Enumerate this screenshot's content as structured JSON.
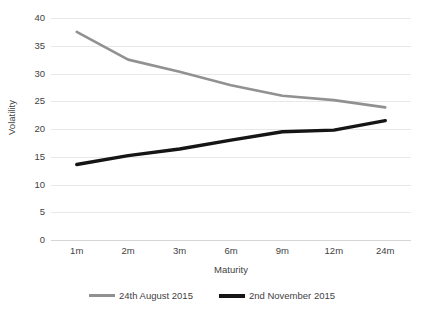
{
  "chart_data": {
    "type": "line",
    "title": "",
    "xlabel": "Maturity",
    "ylabel": "Volatility",
    "categories": [
      "1m",
      "2m",
      "3m",
      "6m",
      "9m",
      "12m",
      "24m"
    ],
    "ylim": [
      0,
      40
    ],
    "yticks": [
      0,
      5,
      10,
      15,
      20,
      25,
      30,
      35,
      40
    ],
    "ytick_labels": [
      "0",
      "5",
      "10",
      "15",
      "20",
      "25",
      "30",
      "35",
      "40"
    ],
    "grid": "horizontal",
    "legend_position": "bottom-center",
    "series": [
      {
        "name": "24th August 2015",
        "color": "#919191",
        "width": 2.6,
        "values": [
          37.5,
          32.5,
          30.3,
          27.9,
          26.0,
          25.2,
          23.9
        ]
      },
      {
        "name": "2nd November 2015",
        "color": "#151515",
        "width": 3.4,
        "values": [
          13.6,
          15.2,
          16.4,
          18.0,
          19.5,
          19.8,
          21.5
        ]
      }
    ]
  },
  "axes": {
    "y_title": "Volatility",
    "x_title": "Maturity"
  },
  "legend": {
    "items": [
      {
        "label": "24th August 2015",
        "color": "#919191"
      },
      {
        "label": "2nd November 2015",
        "color": "#151515"
      }
    ]
  },
  "colors": {
    "grid": "#e8e8e8",
    "baseline": "#d6d6d6",
    "text": "#3f3f3f",
    "background": "#ffffff"
  }
}
